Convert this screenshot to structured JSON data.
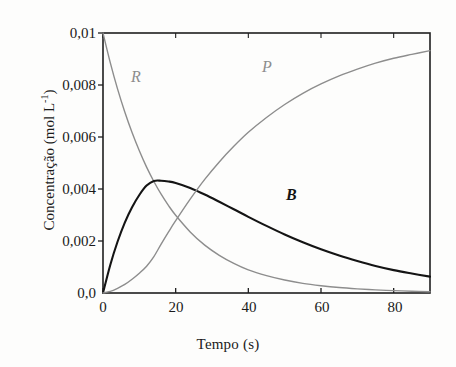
{
  "chart_data": {
    "type": "line",
    "title": "",
    "xlabel": "Tempo (s)",
    "ylabel": "Concentração (mol L",
    "ylabel_sup": "-1",
    "ylabel_suffix": ")",
    "xlim": [
      0,
      90
    ],
    "ylim": [
      0,
      0.01
    ],
    "xticks": [
      0,
      20,
      40,
      60,
      80
    ],
    "xtick_labels": [
      "0",
      "20",
      "40",
      "60",
      "80"
    ],
    "yticks": [
      0,
      0.002,
      0.004,
      0.006,
      0.008,
      0.01
    ],
    "ytick_labels": [
      "0,0",
      "0,002",
      "0,004",
      "0,006",
      "0,008",
      "0,01"
    ],
    "grid": false,
    "legend": "inline-curve-labels",
    "annotations": [
      {
        "text": "R",
        "x": 6.5,
        "y": 0.0082,
        "color": "#8d8d8d",
        "style": "italic"
      },
      {
        "text": "P",
        "x": 45.5,
        "y": 0.0085,
        "color": "#8d8d8d",
        "style": "italic"
      },
      {
        "text": "B",
        "x": 62.0,
        "y": 0.0035,
        "color": "#141414",
        "style": "bold-italic"
      }
    ],
    "series": [
      {
        "name": "R",
        "label": "R",
        "color": "#8d8d8d",
        "width": 1.4,
        "x": [
          0,
          2,
          4,
          6,
          8,
          10,
          12,
          14,
          16,
          18,
          20,
          24,
          28,
          32,
          36,
          40,
          45,
          50,
          55,
          60,
          65,
          70,
          75,
          80,
          85,
          90
        ],
        "values": [
          0.01,
          0.00886,
          0.00785,
          0.00696,
          0.00617,
          0.00547,
          0.00484,
          0.00429,
          0.0038,
          0.00337,
          0.00299,
          0.00235,
          0.00184,
          0.00145,
          0.00114,
          0.00089,
          0.00067,
          0.0005,
          0.00037,
          0.00028,
          0.00021,
          0.00016,
          0.00012,
          9e-05,
          7e-05,
          5e-05
        ]
      },
      {
        "name": "B",
        "label": "B",
        "color": "#141414",
        "width": 2.1,
        "x": [
          0,
          2,
          4,
          6,
          8,
          10,
          12,
          14,
          16,
          18,
          20,
          24,
          28,
          32,
          36,
          40,
          45,
          50,
          55,
          60,
          65,
          70,
          75,
          80,
          85,
          90
        ],
        "values": [
          0,
          0.00108,
          0.00197,
          0.00271,
          0.0033,
          0.00377,
          0.00413,
          0.00431,
          0.00432,
          0.00429,
          0.00423,
          0.00404,
          0.00379,
          0.00351,
          0.00322,
          0.00293,
          0.00258,
          0.00225,
          0.00195,
          0.00168,
          0.00144,
          0.00123,
          0.00104,
          0.00088,
          0.00075,
          0.00063
        ]
      },
      {
        "name": "P",
        "label": "P",
        "color": "#8d8d8d",
        "width": 1.4,
        "x": [
          0,
          2,
          4,
          6,
          8,
          10,
          12,
          14,
          16,
          18,
          20,
          24,
          28,
          32,
          36,
          40,
          45,
          50,
          55,
          60,
          65,
          70,
          75,
          80,
          85,
          90
        ],
        "values": [
          0,
          6e-05,
          0.00018,
          0.00033,
          0.00053,
          0.00076,
          0.00103,
          0.0014,
          0.00188,
          0.00234,
          0.00278,
          0.00361,
          0.00437,
          0.00504,
          0.00564,
          0.00618,
          0.00675,
          0.00725,
          0.00768,
          0.00804,
          0.00835,
          0.00861,
          0.00884,
          0.00903,
          0.00918,
          0.00932
        ]
      }
    ]
  },
  "axes": {
    "frame_color": "#1f1f1f",
    "background": "#fdfdfc"
  }
}
